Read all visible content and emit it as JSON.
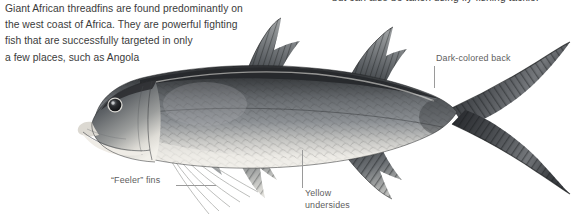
{
  "page": {
    "background_color": "#ffffff",
    "width": 587,
    "height": 220
  },
  "body_text": {
    "left_paragraph": "Giant African threadfins are found predominantly on\nthe west coast of Africa. They are powerful fighting\nfish that are successfully targeted in only\na few places, such as Angola",
    "right_paragraph_fragment": "but can also be taken using fly-fishing tackle."
  },
  "callouts": [
    {
      "id": "dark-colored-back",
      "label": "Dark-colored back",
      "leader": "vertical-down"
    },
    {
      "id": "feeler-fins",
      "label": "“Feeler” fins",
      "leader": "horizontal-right"
    },
    {
      "id": "yellow-undersides",
      "label": "Yellow\nundersides",
      "leader": "vertical-up"
    }
  ],
  "illustration": {
    "subject": "giant-african-threadfin-fish",
    "orientation": "facing-left",
    "style": "grayscale-photographic-cutout",
    "features": [
      "dark-colored back",
      "two separate dorsal fins",
      "deeply forked caudal fin",
      "pale yellow undersides",
      "long thread-like pectoral feeler filaments",
      "underslung mouth",
      "large round eye",
      "scaled flank with lateral line"
    ],
    "colors": {
      "back": "#3a3c3e",
      "flank": "#6e7276",
      "belly": "#e9e8e4",
      "fin": "#5a5d61",
      "outline": "#2b2d2f"
    }
  }
}
